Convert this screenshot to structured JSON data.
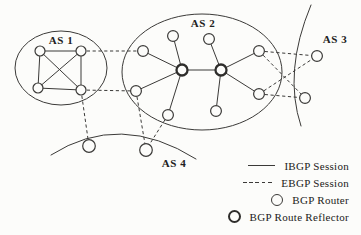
{
  "colors": {
    "ink": "#3b3a38",
    "ink_bold": "#2e2d2b",
    "paper": "#fcfcfa",
    "text": "#222120"
  },
  "diagram": {
    "style": {
      "region_stroke": 1,
      "link_stroke": 1,
      "dash": "3.2,2.6",
      "router_stroke": 1.2,
      "reflector_stroke": 2.3
    },
    "regions": [
      {
        "id": "as1",
        "shape": "ellipse",
        "cx": 61,
        "cy": 68,
        "rx": 46,
        "ry": 37
      },
      {
        "id": "as2",
        "shape": "ellipse",
        "cx": 202,
        "cy": 72,
        "rx": 80,
        "ry": 58
      },
      {
        "id": "as3",
        "shape": "arc",
        "path": "M 311,5 Q 283,72 301,126"
      },
      {
        "id": "as4",
        "shape": "arc",
        "path": "M 51,155 Q 120,111 196,159"
      }
    ],
    "as_labels": [
      {
        "id": "as1",
        "text": "AS 1",
        "x": 61,
        "y": 44
      },
      {
        "id": "as2",
        "text": "AS 2",
        "x": 203,
        "y": 27
      },
      {
        "id": "as3",
        "text": "AS 3",
        "x": 335,
        "y": 43
      },
      {
        "id": "as4",
        "text": "AS 4",
        "x": 174,
        "y": 167
      }
    ],
    "nodes": [
      {
        "id": "a1",
        "as": "as1",
        "type": "router",
        "x": 40,
        "y": 51,
        "r": 5
      },
      {
        "id": "a2",
        "as": "as1",
        "type": "router",
        "x": 81,
        "y": 51,
        "r": 5
      },
      {
        "id": "a3",
        "as": "as1",
        "type": "router",
        "x": 38,
        "y": 88,
        "r": 5
      },
      {
        "id": "a4",
        "as": "as1",
        "type": "router",
        "x": 81,
        "y": 90,
        "r": 5
      },
      {
        "id": "b1",
        "as": "as2",
        "type": "router",
        "x": 143,
        "y": 51,
        "r": 5.4
      },
      {
        "id": "b2",
        "as": "as2",
        "type": "router",
        "x": 173,
        "y": 36,
        "r": 5.4
      },
      {
        "id": "b3",
        "as": "as2",
        "type": "router",
        "x": 209,
        "y": 39,
        "r": 5.4
      },
      {
        "id": "b4",
        "as": "as2",
        "type": "router",
        "x": 259,
        "y": 51,
        "r": 5.4
      },
      {
        "id": "b5",
        "as": "as2",
        "type": "router",
        "x": 136,
        "y": 91,
        "r": 5.4
      },
      {
        "id": "b6",
        "as": "as2",
        "type": "router",
        "x": 259,
        "y": 94,
        "r": 5.4
      },
      {
        "id": "b7",
        "as": "as2",
        "type": "router",
        "x": 168,
        "y": 115,
        "r": 5.4
      },
      {
        "id": "b8",
        "as": "as2",
        "type": "router",
        "x": 216,
        "y": 111,
        "r": 5.4
      },
      {
        "id": "rl",
        "as": "as2",
        "type": "reflector",
        "x": 182,
        "y": 70,
        "r": 5.5
      },
      {
        "id": "rr",
        "as": "as2",
        "type": "reflector",
        "x": 221,
        "y": 70,
        "r": 5.5
      },
      {
        "id": "c1",
        "as": "as3",
        "type": "router",
        "x": 317,
        "y": 56,
        "r": 5.4
      },
      {
        "id": "c2",
        "as": "as3",
        "type": "router",
        "x": 305,
        "y": 98,
        "r": 5.4
      },
      {
        "id": "d1",
        "as": "as4",
        "type": "router",
        "x": 89,
        "y": 146,
        "r": 6.3
      },
      {
        "id": "d2",
        "as": "as4",
        "type": "router",
        "x": 146,
        "y": 150,
        "r": 6.3
      }
    ],
    "ibgp_links": [
      [
        "a1",
        "a2"
      ],
      [
        "a3",
        "a4"
      ],
      [
        "a1",
        "a3"
      ],
      [
        "a2",
        "a4"
      ],
      [
        "a1",
        "a4"
      ],
      [
        "a2",
        "a3"
      ],
      [
        "rl",
        "b1"
      ],
      [
        "rl",
        "b2"
      ],
      [
        "rl",
        "b5"
      ],
      [
        "rl",
        "b7"
      ],
      [
        "rr",
        "b3"
      ],
      [
        "rr",
        "b4"
      ],
      [
        "rr",
        "b6"
      ],
      [
        "rr",
        "b8"
      ],
      [
        "rl",
        "rr"
      ]
    ],
    "ebgp_links": [
      [
        "a2",
        "b1"
      ],
      [
        "a4",
        "b5"
      ],
      [
        "a4",
        "d1"
      ],
      [
        "b5",
        "d2"
      ],
      [
        "b7",
        "d2"
      ],
      [
        "b4",
        "c1"
      ],
      [
        "b4",
        "c2"
      ],
      [
        "b6",
        "c1"
      ],
      [
        "b6",
        "c2"
      ]
    ]
  },
  "legend": {
    "items": [
      {
        "symbol": "solid-line",
        "label": "IBGP Session"
      },
      {
        "symbol": "dashed-line",
        "label": "EBGP Session"
      },
      {
        "symbol": "router-circle",
        "label": "BGP Router"
      },
      {
        "symbol": "reflector-circle",
        "label": "BGP Route Reflector"
      }
    ]
  }
}
